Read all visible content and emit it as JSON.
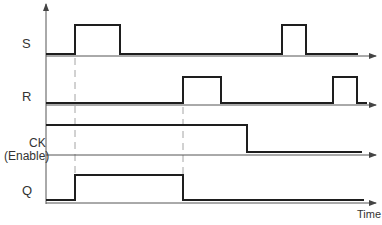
{
  "diagram": {
    "type": "timing-diagram",
    "x_axis_label": "Time",
    "colors": {
      "signal": "#1e1e1e",
      "axis": "#555555",
      "dashed": "#9a9a9a",
      "label": "#333333"
    },
    "signals": [
      {
        "name": "S",
        "label": "S",
        "sublabel": "",
        "description": "Set input: two pulses",
        "transitions": [
          {
            "t": "start",
            "level": 0
          },
          {
            "t": "t1",
            "level": 1
          },
          {
            "t": "t1b",
            "level": 0
          },
          {
            "t": "t4",
            "level": 1
          },
          {
            "t": "t4b",
            "level": 0
          }
        ]
      },
      {
        "name": "R",
        "label": "R",
        "sublabel": "",
        "description": "Reset input: two pulses",
        "transitions": [
          {
            "t": "start",
            "level": 0
          },
          {
            "t": "t2",
            "level": 1
          },
          {
            "t": "t2b",
            "level": 0
          },
          {
            "t": "t5",
            "level": 1
          },
          {
            "t": "t5b",
            "level": 0
          }
        ]
      },
      {
        "name": "CK",
        "label": "CK",
        "sublabel": "(Enable)",
        "description": "Clock/enable: high then low",
        "transitions": [
          {
            "t": "start",
            "level": 1
          },
          {
            "t": "t3",
            "level": 0
          }
        ]
      },
      {
        "name": "Q",
        "label": "Q",
        "sublabel": "",
        "description": "Output: set at t1, reset at t2",
        "transitions": [
          {
            "t": "start",
            "level": 0
          },
          {
            "t": "t1",
            "level": 1
          },
          {
            "t": "t2",
            "level": 0
          }
        ]
      }
    ],
    "reference_lines": [
      {
        "at": "t1",
        "style": "dashed",
        "from_signal": "S",
        "to_signal": "Q"
      },
      {
        "at": "t2",
        "style": "dashed",
        "from_signal": "R",
        "to_signal": "Q"
      }
    ]
  }
}
